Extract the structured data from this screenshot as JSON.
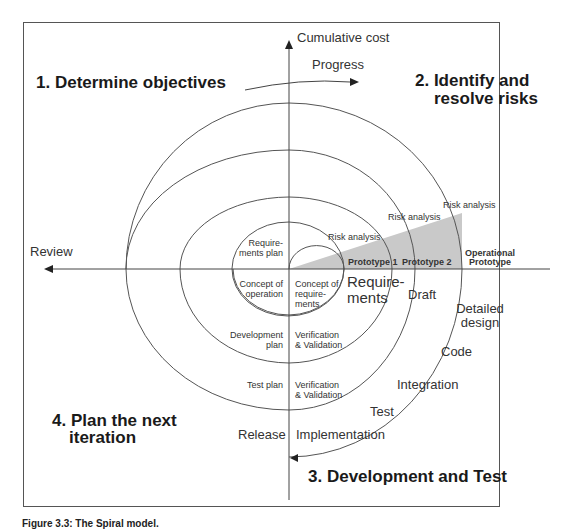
{
  "diagram": {
    "axes": {
      "vertical_label": "Cumulative cost",
      "horizontal_label": "Review",
      "progress_label": "Progress"
    },
    "phases": [
      {
        "number": "1.",
        "line1": "1. Determine objectives",
        "line2": ""
      },
      {
        "number": "2.",
        "line1": "2. Identify and",
        "line2": "resolve risks"
      },
      {
        "number": "3.",
        "line1": "3. Development and Test",
        "line2": ""
      },
      {
        "number": "4.",
        "line1": "4. Plan the next",
        "line2": "iteration"
      }
    ],
    "risk_analysis": [
      "Risk analysis",
      "Risk analysis",
      "Risk analysis"
    ],
    "prototypes": [
      "Prototype 1",
      "Prototype 2",
      "Operational",
      "Prototype"
    ],
    "quadrant4": {
      "requirements_plan": [
        "Require-",
        "ments plan"
      ],
      "concept_of_operation": [
        "Concept of",
        "operation"
      ],
      "development_plan": [
        "Development",
        "plan"
      ],
      "test_plan": "Test plan",
      "release": "Release"
    },
    "quadrant3": {
      "concept_of_requirements": [
        "Concept of",
        "require-",
        "ments"
      ],
      "requirements": [
        "Require-",
        "ments"
      ],
      "draft": "Draft",
      "detailed_design": [
        "Detailed",
        "design"
      ],
      "code": "Code",
      "integration": "Integration",
      "test": "Test",
      "implementation": "Implementation",
      "vv1": [
        "Verification",
        "& Validation"
      ],
      "vv2": [
        "Verification",
        "& Validation"
      ]
    },
    "colors": {
      "line": "#555555",
      "wedge": "#c8c8c8",
      "text": "#222222"
    }
  },
  "caption": "Figure 3.3: The Spiral model."
}
